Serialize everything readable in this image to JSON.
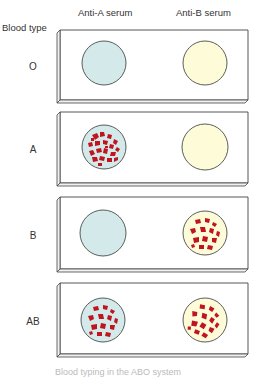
{
  "figure": {
    "column_headers": [
      "Anti-A serum",
      "Anti-B serum"
    ],
    "row_header": "Blood type",
    "rows": [
      {
        "type": "O",
        "anti_a_agglutination": false,
        "anti_b_agglutination": false
      },
      {
        "type": "A",
        "anti_a_agglutination": true,
        "anti_b_agglutination": false
      },
      {
        "type": "B",
        "anti_a_agglutination": false,
        "anti_b_agglutination": true
      },
      {
        "type": "AB",
        "anti_a_agglutination": true,
        "anti_b_agglutination": true
      }
    ],
    "caption": "Blood typing in the ABO system"
  },
  "colors": {
    "anti_a_serum": "#d4eaea",
    "anti_b_serum": "#fdfbd8",
    "agglutinated_cells": "#c0141e",
    "slide_outline": "#444444"
  }
}
